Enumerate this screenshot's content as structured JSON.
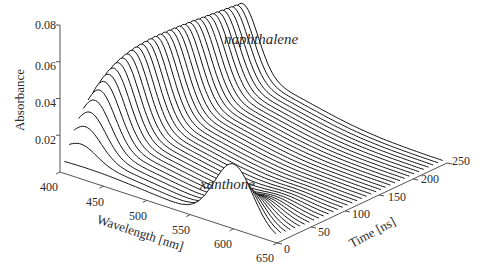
{
  "chart_data": {
    "type": "waterfall-3d",
    "title": "",
    "xlabel": "Wavelength [nm]",
    "ylabel": "Time [ns]",
    "zlabel": "Absorbance",
    "x_ticks": [
      400,
      450,
      500,
      550,
      600,
      650
    ],
    "y_ticks": [
      0,
      50,
      100,
      150,
      200,
      250
    ],
    "z_ticks": [
      0.02,
      0.04,
      0.06,
      0.08
    ],
    "xlim": [
      400,
      650
    ],
    "ylim": [
      0,
      250
    ],
    "zlim": [
      0,
      0.08
    ],
    "n_traces": 36,
    "annotations": [
      {
        "text": "naphthalene",
        "near_wavelength": 420,
        "near_time": 150
      },
      {
        "text": "xanthone",
        "near_wavelength": 600,
        "near_time": 0
      }
    ],
    "series": [
      {
        "name": "xanthone",
        "peak_wavelength": 600,
        "peak_absorbance_t0": 0.033,
        "width_nm": 22,
        "decay_ns": 30
      },
      {
        "name": "naphthalene",
        "peak_wavelength": 418,
        "peak_absorbance_max": 0.05,
        "width_nm": 18,
        "rise_ns": 35,
        "decay_ns": 900
      },
      {
        "name": "broad_background",
        "center_wavelength": 430,
        "absorbance_max": 0.012,
        "width_nm": 70
      }
    ],
    "grid": false,
    "legend": "none"
  },
  "labels": {
    "z_ticks": [
      "0.02",
      "0.04",
      "0.06",
      "0.08"
    ],
    "x_ticks": [
      "400",
      "450",
      "500",
      "550",
      "600",
      "650"
    ],
    "y_ticks": [
      "0",
      "50",
      "100",
      "150",
      "200",
      "250"
    ],
    "zlabel": "Absorbance",
    "xlabel": "Wavelength [nm]",
    "ylabel": "Time [ns]",
    "annot_naphthalene": "naphthalene",
    "annot_xanthone": "xanthone"
  },
  "style": {
    "line_color": "#111111",
    "axis_color": "#555555",
    "text_color": "#2a2a2a"
  }
}
